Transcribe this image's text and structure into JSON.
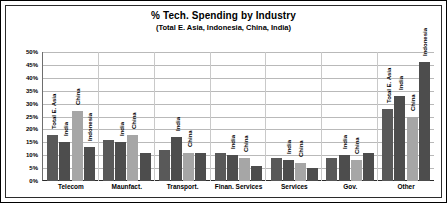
{
  "chart_data": {
    "type": "bar",
    "title": "% Tech. Spending by Industry",
    "subtitle": "(Total E. Asia, Indonesia, China, India)",
    "xlabel": "",
    "ylabel": "",
    "ylim": [
      0,
      50
    ],
    "grid": true,
    "legend_position": "none",
    "y_ticks": [
      "50%",
      "45%",
      "40%",
      "35%",
      "30%",
      "25%",
      "20%",
      "15%",
      "10%",
      "5%",
      "0%"
    ],
    "y_tick_values": [
      50,
      45,
      40,
      35,
      30,
      25,
      20,
      15,
      10,
      5,
      0
    ],
    "categories": [
      "Telecom",
      "Maunfact.",
      "Transport.",
      "Finan. Services",
      "Services",
      "Gov.",
      "Other"
    ],
    "series": [
      {
        "name": "Total E. Asia",
        "color": "#595959",
        "values": [
          18,
          16,
          12,
          11,
          9,
          9,
          28
        ]
      },
      {
        "name": "India",
        "color": "#4d4d4d",
        "values": [
          15,
          15,
          17,
          10,
          8,
          10,
          33
        ]
      },
      {
        "name": "China",
        "color": "#a6a6a6",
        "values": [
          27,
          18,
          11,
          9,
          7,
          8,
          25
        ]
      },
      {
        "name": "Indonesia",
        "color": "#4d4d4d",
        "values": [
          13,
          11,
          11,
          6,
          5,
          11,
          46
        ]
      }
    ],
    "bar_annotations": [
      [
        "Total E. Asia",
        "India",
        "China",
        "Indonesia"
      ],
      [
        "",
        "India",
        "China",
        ""
      ],
      [
        "",
        "India",
        "China",
        ""
      ],
      [
        "",
        "India",
        "China",
        ""
      ],
      [
        "",
        "India",
        "China",
        ""
      ],
      [
        "",
        "India",
        "China",
        ""
      ],
      [
        "Total E. Asia",
        "India",
        "China",
        "Indonesia"
      ]
    ]
  }
}
